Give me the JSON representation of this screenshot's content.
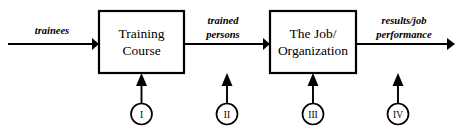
{
  "diagram": {
    "background_color": "#ffffff",
    "line_color": "#000000",
    "boxes": [
      {
        "id": "training-course",
        "line1": "Training",
        "line2": "Course"
      },
      {
        "id": "job-organization",
        "line1": "The Job/",
        "line2": "Organization"
      }
    ],
    "edge_labels": [
      {
        "id": "trainees",
        "line1": "trainees",
        "line2": ""
      },
      {
        "id": "trained-persons",
        "line1": "trained",
        "line2": "persons"
      },
      {
        "id": "results-job-performance",
        "line1": "results/job",
        "line2": "performance"
      }
    ],
    "markers": [
      {
        "id": "marker-1",
        "label": "I"
      },
      {
        "id": "marker-2",
        "label": "II"
      },
      {
        "id": "marker-3",
        "label": "III"
      },
      {
        "id": "marker-4",
        "label": "IV"
      }
    ]
  }
}
